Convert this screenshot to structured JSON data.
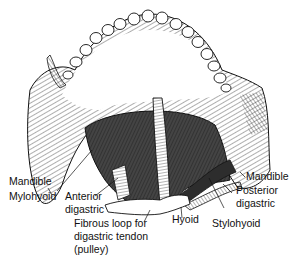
{
  "figure": {
    "labels": {
      "mandible_left": "Mandible",
      "mylohyoid": "Mylohyoid",
      "anterior_digastric_1": "Anterior",
      "anterior_digastric_2": "digastric",
      "fibrous_loop_1": "Fibrous loop for",
      "fibrous_loop_2": "digastric tendon",
      "fibrous_loop_3": "(pulley)",
      "hyoid": "Hyoid",
      "stylohyoid": "Stylohyoid",
      "mandible_right": "Mandible",
      "posterior_digastric_1": "Posterior",
      "posterior_digastric_2": "digastric"
    },
    "colors": {
      "line": "#111111",
      "muscle_dark": "#3a3a3a",
      "muscle_mid": "#6a6a6a",
      "background": "#ffffff"
    }
  }
}
